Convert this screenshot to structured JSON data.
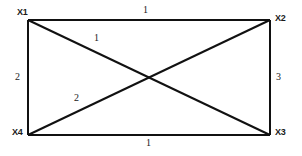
{
  "diagram": {
    "type": "weighted-graph-rectangle",
    "background_color": "#ffffff",
    "line_color": "#111111",
    "vertices": [
      {
        "id": "x1",
        "label": "X1",
        "position": "top-left"
      },
      {
        "id": "x2",
        "label": "X2",
        "position": "top-right"
      },
      {
        "id": "x3",
        "label": "X3",
        "position": "bottom-right"
      },
      {
        "id": "x4",
        "label": "X4",
        "position": "bottom-left"
      }
    ],
    "edges": [
      {
        "id": "top",
        "from": "X1",
        "to": "X2",
        "weight": "1"
      },
      {
        "id": "right",
        "from": "X2",
        "to": "X3",
        "weight": "3"
      },
      {
        "id": "bottom",
        "from": "X4",
        "to": "X3",
        "weight": "1"
      },
      {
        "id": "left",
        "from": "X1",
        "to": "X4",
        "weight": "2"
      },
      {
        "id": "diagonal-1",
        "from": "X1",
        "to": "X3",
        "weight": "1"
      },
      {
        "id": "diagonal-2",
        "from": "X4",
        "to": "X2",
        "weight": "2"
      }
    ]
  }
}
